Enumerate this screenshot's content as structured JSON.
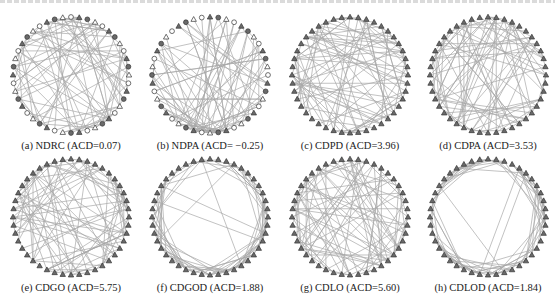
{
  "header": {
    "cutoff_text_line": "partially visible line of document text (illegible, cropped at top)"
  },
  "figure": {
    "panels": [
      {
        "id": "a",
        "caption": "(a) NDRC (ACD=0.07)",
        "method": "NDRC",
        "acd": 0.07,
        "node_style": "mixed",
        "edge_pattern": "random-dense",
        "cx": 71,
        "cy": 75
      },
      {
        "id": "b",
        "caption": "(b) NDPA (ACD= −0.25)",
        "method": "NDPA",
        "acd": -0.25,
        "node_style": "mixed",
        "edge_pattern": "hub-bottom",
        "cx": 210,
        "cy": 75
      },
      {
        "id": "c",
        "caption": "(c) CDPD (ACD=3.96)",
        "method": "CDPD",
        "acd": 3.96,
        "node_style": "triangle",
        "edge_pattern": "random-dense",
        "cx": 350,
        "cy": 75
      },
      {
        "id": "d",
        "caption": "(d) CDPA (ACD=3.53)",
        "method": "CDPA",
        "acd": 3.53,
        "node_style": "triangle",
        "edge_pattern": "random-dense",
        "cx": 488,
        "cy": 75
      },
      {
        "id": "e",
        "caption": "(e) CDGO (ACD=5.75)",
        "method": "CDGO",
        "acd": 5.75,
        "node_style": "triangle",
        "edge_pattern": "random-dense",
        "cx": 71,
        "cy": 217
      },
      {
        "id": "f",
        "caption": "(f) CDGOD (ACD=1.88)",
        "method": "CDGOD",
        "acd": 1.88,
        "node_style": "triangle",
        "edge_pattern": "ring-local",
        "cx": 210,
        "cy": 217
      },
      {
        "id": "g",
        "caption": "(g) CDLO (ACD=5.60)",
        "method": "CDLO",
        "acd": 5.6,
        "node_style": "triangle",
        "edge_pattern": "random-dense",
        "cx": 350,
        "cy": 217
      },
      {
        "id": "h",
        "caption": "(h) CDLOD (ACD=1.84)",
        "method": "CDLOD",
        "acd": 1.84,
        "node_style": "triangle",
        "edge_pattern": "ring-local",
        "cx": 488,
        "cy": 217
      }
    ],
    "node_count": 44,
    "radius": 58,
    "colors": {
      "edge": "#a8a8a8",
      "node_stroke": "#333333",
      "node_fill_dark": "#6a6a6a",
      "node_fill_light": "#ffffff",
      "caption_text": "#222222"
    }
  }
}
